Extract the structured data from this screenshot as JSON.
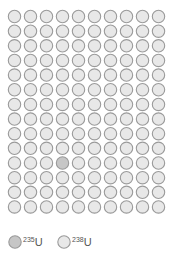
{
  "figure": {
    "title": "",
    "grid": {
      "rows": 14,
      "columns": 10,
      "total_atoms": 140,
      "highlighted": [
        {
          "row": 10,
          "col": 3,
          "isotope": "235U"
        }
      ]
    },
    "legend": [
      {
        "id": "u235",
        "mass_number": "235",
        "symbol": "U",
        "label": "235U",
        "fill": "#c6c6c6",
        "stroke": "#9a9a9a"
      },
      {
        "id": "u238",
        "mass_number": "238",
        "symbol": "U",
        "label": "238U",
        "fill": "#e8e8e8",
        "stroke": "#9a9a9a"
      }
    ]
  },
  "colors": {
    "background": "#ffffff",
    "u235_fill": "#c6c6c6",
    "u238_fill": "#e8e8e8",
    "stroke": "#9a9a9a",
    "text": "#555555"
  }
}
